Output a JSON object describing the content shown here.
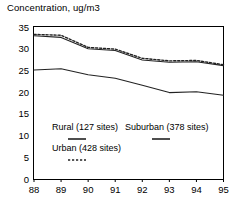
{
  "chart_data": {
    "type": "line",
    "title": "Concentration, ug/m3",
    "xlabel": "",
    "ylabel": "",
    "x": [
      88,
      89,
      90,
      91,
      92,
      93,
      94,
      95
    ],
    "xtick_labels": [
      "88",
      "89",
      "90",
      "91",
      "92",
      "93",
      "94",
      "95"
    ],
    "ytick_labels": [
      "0",
      "5",
      "10",
      "15",
      "20",
      "25",
      "30",
      "35"
    ],
    "yticks": [
      0,
      5,
      10,
      15,
      20,
      25,
      30,
      35
    ],
    "ylim": [
      0,
      35
    ],
    "xlim": [
      88,
      95
    ],
    "grid": false,
    "legend_position": "inside-lower-left",
    "series": [
      {
        "name": "Suburban (378 sites)",
        "label": "Suburban (378 sites)",
        "style": "dashed",
        "color": "#222222",
        "values": [
          33.3,
          33.1,
          30.3,
          29.9,
          27.8,
          27.2,
          27.3,
          26.3
        ]
      },
      {
        "name": "Rural (127 sites)",
        "label": "Rural (127 sites)",
        "style": "solid",
        "color": "#222222",
        "values": [
          33.0,
          32.6,
          30.0,
          29.6,
          27.4,
          26.9,
          27.0,
          26.1
        ]
      },
      {
        "name": "Urban (428 sites)",
        "label": "Urban (428 sites)",
        "style": "solid",
        "color": "#222222",
        "values": [
          25.1,
          25.4,
          24.0,
          23.2,
          21.6,
          19.9,
          20.1,
          19.3
        ]
      }
    ]
  },
  "legend": {
    "entries": [
      {
        "label": "Rural (127 sites)",
        "style": "solid"
      },
      {
        "label": "Suburban (378 sites)",
        "style": "solid"
      },
      {
        "label": "Urban (428 sites)",
        "style": "dashed"
      }
    ]
  }
}
